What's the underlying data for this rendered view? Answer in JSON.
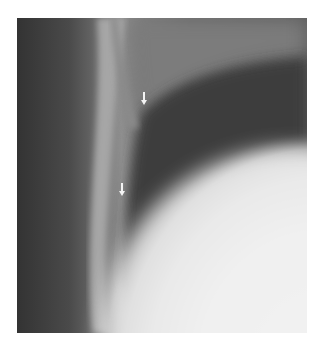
{
  "image": {
    "description": "Grayscale chest radiograph close-up showing a curved rib margin and pleural/lung boundary",
    "arrows": [
      {
        "label": "arrow-upper",
        "x": 143,
        "y": 92,
        "direction": "down"
      },
      {
        "label": "arrow-lower",
        "x": 121,
        "y": 183,
        "direction": "down"
      }
    ],
    "colors": {
      "background": "#ffffff",
      "dark_edge": "#353535",
      "rib_band": "#a8a8a8",
      "lung_dark": "#404040",
      "lower_bright": "#f2f2f2",
      "arrow": "#f4f4f4"
    }
  }
}
